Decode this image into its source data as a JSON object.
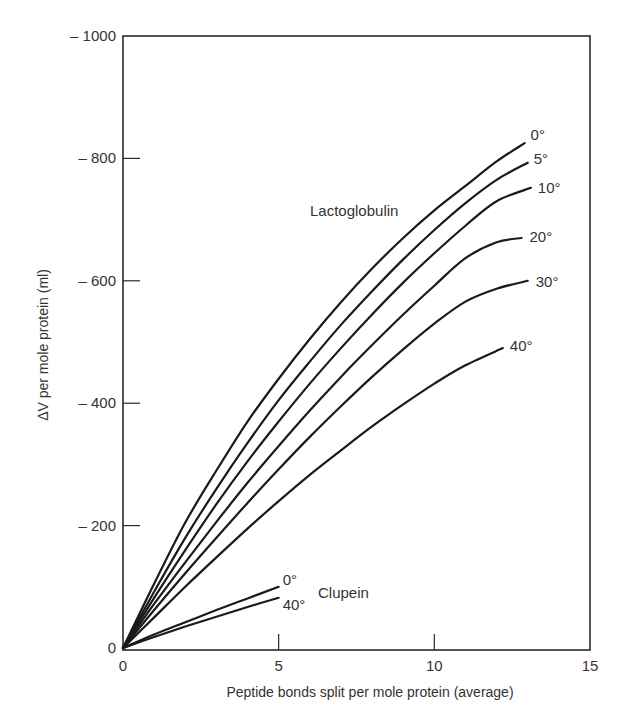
{
  "chart_data": {
    "type": "line",
    "title": "",
    "xlabel": "Peptide bonds split per mole protein (average)",
    "ylabel": "ΔV per mole protein (ml)",
    "xlim": [
      0,
      15
    ],
    "ylim": [
      0,
      -1000
    ],
    "x_ticks": [
      0,
      5,
      10,
      15
    ],
    "y_ticks": [
      0,
      -200,
      -400,
      -600,
      -800,
      -1000
    ],
    "x_tick_labels": [
      "0",
      "5",
      "10",
      "15"
    ],
    "y_tick_labels": [
      "0",
      "– 200",
      "– 400",
      "– 600",
      "– 800",
      "– 1000"
    ],
    "grid": false,
    "legend": "inline labels at line ends",
    "annotations": [
      {
        "text": "Lactoglobulin",
        "x": 7.3,
        "y": -700
      },
      {
        "text": "Clupein",
        "x": 6.2,
        "y": -100
      }
    ],
    "series": [
      {
        "name": "Lactoglobulin 0°",
        "label": "0°",
        "group": "Lactoglobulin",
        "x": [
          0,
          1,
          2,
          3,
          4,
          5,
          6,
          7,
          8,
          9,
          10,
          11,
          12,
          12.9
        ],
        "y": [
          0,
          -105,
          -205,
          -290,
          -370,
          -440,
          -505,
          -565,
          -620,
          -670,
          -715,
          -755,
          -795,
          -825
        ]
      },
      {
        "name": "Lactoglobulin 5°",
        "label": "5°",
        "group": "Lactoglobulin",
        "x": [
          0,
          1,
          2,
          3,
          4,
          5,
          6,
          7,
          8,
          9,
          10,
          11,
          12,
          13
        ],
        "y": [
          0,
          -92,
          -180,
          -260,
          -335,
          -405,
          -468,
          -528,
          -583,
          -635,
          -683,
          -727,
          -765,
          -793
        ]
      },
      {
        "name": "Lactoglobulin 10°",
        "label": "10°",
        "group": "Lactoglobulin",
        "x": [
          0,
          1,
          2,
          3,
          4,
          5,
          6,
          7,
          8,
          9,
          10,
          11,
          12,
          13.1
        ],
        "y": [
          0,
          -82,
          -160,
          -235,
          -305,
          -370,
          -432,
          -490,
          -545,
          -597,
          -645,
          -690,
          -730,
          -752
        ]
      },
      {
        "name": "Lactoglobulin 20°",
        "label": "20°",
        "group": "Lactoglobulin",
        "x": [
          0,
          1,
          2,
          3,
          4,
          5,
          6,
          7,
          8,
          9,
          10,
          11,
          12,
          12.8
        ],
        "y": [
          0,
          -72,
          -140,
          -206,
          -270,
          -330,
          -388,
          -443,
          -495,
          -545,
          -592,
          -637,
          -663,
          -670
        ]
      },
      {
        "name": "Lactoglobulin 30°",
        "label": "30°",
        "group": "Lactoglobulin",
        "x": [
          0,
          1,
          2,
          3,
          4,
          5,
          6,
          7,
          8,
          9,
          10,
          11,
          12,
          13
        ],
        "y": [
          0,
          -62,
          -122,
          -180,
          -237,
          -292,
          -345,
          -395,
          -443,
          -488,
          -530,
          -566,
          -587,
          -600
        ]
      },
      {
        "name": "Lactoglobulin 40°",
        "label": "40°",
        "group": "Lactoglobulin",
        "x": [
          0,
          1,
          2,
          3,
          4,
          5,
          6,
          7,
          8,
          9,
          10,
          11,
          12.2
        ],
        "y": [
          0,
          -50,
          -100,
          -148,
          -195,
          -240,
          -283,
          -323,
          -362,
          -398,
          -432,
          -462,
          -490
        ]
      },
      {
        "name": "Clupein 0°",
        "label": "0°",
        "group": "Clupein",
        "x": [
          0,
          1,
          2,
          3,
          4,
          5
        ],
        "y": [
          0,
          -22,
          -42,
          -62,
          -81,
          -100
        ]
      },
      {
        "name": "Clupein 40°",
        "label": "40°",
        "group": "Clupein",
        "x": [
          0,
          1,
          2,
          3,
          4,
          5
        ],
        "y": [
          0,
          -18,
          -35,
          -51,
          -67,
          -82
        ]
      }
    ]
  },
  "colors": {
    "line": "#1a1a1a",
    "axis": "#2a2a2a",
    "text": "#333333",
    "background": "#ffffff"
  }
}
